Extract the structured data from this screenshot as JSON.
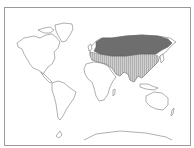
{
  "map": {
    "type": "world-distribution-map",
    "projection": "equirectangular-like",
    "frame": {
      "border_color": "#9a9a9a"
    },
    "colors": {
      "land_fill": "#ffffff",
      "coastline": "#7a7a7a",
      "range_primary": "#6e6e6e",
      "range_secondary": "#cfcfcf",
      "range_secondary_hatch": "#9a9a9a"
    },
    "regions": [
      {
        "name": "range-primary",
        "description": "Northern Eurasia band (Scandinavia to Kamchatka)",
        "style": "solid dark gray"
      },
      {
        "name": "range-secondary",
        "description": "Southern Eurasia (Europe south, Middle East, India, China, SE Asia)",
        "style": "light gray with vertical hatching"
      }
    ],
    "unshaded_landmasses": [
      "North America",
      "Greenland",
      "South America",
      "Africa",
      "Australia",
      "Antarctica"
    ]
  }
}
